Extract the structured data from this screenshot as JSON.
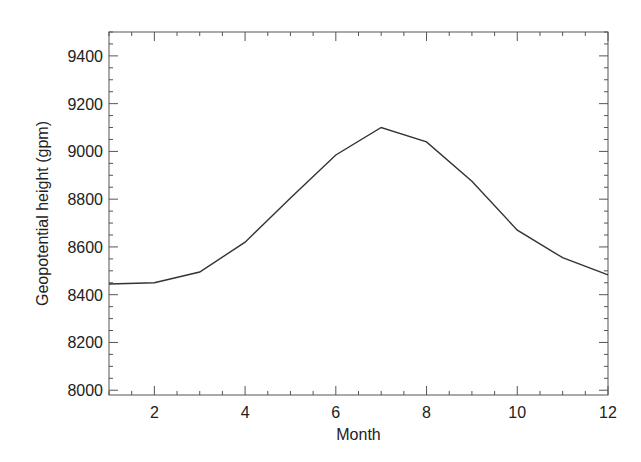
{
  "chart_data": {
    "type": "line",
    "title": "",
    "xlabel": "Month",
    "ylabel": "Geopotential height (gpm)",
    "xlim": [
      1,
      12
    ],
    "ylim": [
      7980,
      9500
    ],
    "x_ticks": [
      2,
      4,
      6,
      8,
      10,
      12
    ],
    "y_ticks": [
      8000,
      8200,
      8400,
      8600,
      8800,
      9000,
      9200,
      9400
    ],
    "grid": false,
    "legend": null,
    "series": [
      {
        "name": "Geopotential height",
        "color": "#333333",
        "x": [
          1,
          2,
          3,
          4,
          5,
          6,
          7,
          8,
          9,
          10,
          11,
          12
        ],
        "values": [
          8445,
          8450,
          8495,
          8620,
          8805,
          8985,
          9100,
          9040,
          8875,
          8670,
          8555,
          8483
        ]
      }
    ]
  },
  "axes": {
    "xlabel": "Month",
    "ylabel": "Geopotential height (gpm)"
  },
  "colors": {
    "axis": "#555555",
    "line": "#333333",
    "text": "#222222"
  }
}
